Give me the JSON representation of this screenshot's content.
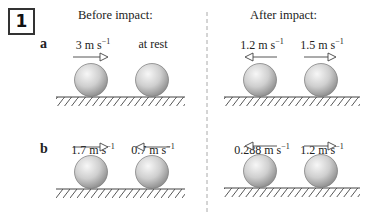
{
  "question_number": "1",
  "headings": {
    "before": "Before impact:",
    "after": "After impact:"
  },
  "rows": [
    {
      "label": "a",
      "before": [
        {
          "value": "3",
          "unit": "m s",
          "exp": "−1",
          "direction": "right"
        },
        {
          "value": "at rest",
          "unit": "",
          "exp": "",
          "direction": "none"
        }
      ],
      "after": [
        {
          "value": "1.2",
          "unit": "m s",
          "exp": "−1",
          "direction": "left"
        },
        {
          "value": "1.5",
          "unit": "m s",
          "exp": "−1",
          "direction": "right"
        }
      ]
    },
    {
      "label": "b",
      "before": [
        {
          "value": "1.7",
          "unit": "m s",
          "exp": "−1",
          "direction": "right"
        },
        {
          "value": "0.7",
          "unit": "m s",
          "exp": "−1",
          "direction": "left"
        }
      ],
      "after": [
        {
          "value": "0.288",
          "unit": "m s",
          "exp": "−1",
          "direction": "left"
        },
        {
          "value": "1.2",
          "unit": "m s",
          "exp": "−1",
          "direction": "right"
        }
      ]
    }
  ],
  "colors": {
    "sphere_light": "#f4f4f4",
    "sphere_dark": "#9a9a9a",
    "line": "#444444",
    "divider": "#aaaaaa"
  }
}
